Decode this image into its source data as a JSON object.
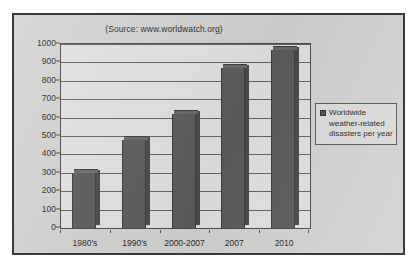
{
  "chart_data": {
    "type": "bar",
    "title": "(Source: www.worldwatch.org)",
    "xlabel": "",
    "ylabel": "",
    "categories": [
      "1980's",
      "1990's",
      "2000-2007",
      "2007",
      "2010"
    ],
    "values": [
      300,
      480,
      620,
      870,
      970
    ],
    "series": [
      {
        "name": "Worldwide weather-related disasters per year",
        "values": [
          300,
          480,
          620,
          870,
          970
        ]
      }
    ],
    "ylim": [
      0,
      1000
    ],
    "ytick_labels": [
      "0",
      "100",
      "200",
      "300",
      "400",
      "500",
      "600",
      "700",
      "800",
      "900",
      "1000"
    ],
    "ytick_values": [
      0,
      100,
      200,
      300,
      400,
      500,
      600,
      700,
      800,
      900,
      1000
    ],
    "grid": true,
    "legend_position": "right",
    "legend_entries": [
      "Worldwide weather-related disasters per year"
    ]
  },
  "legend": {
    "line1": "Worldwide",
    "line2": "weather-related",
    "line3": "disasters per year",
    "marker": "square-marker"
  },
  "colors": {
    "bar_front": "#5c5c5c",
    "bar_side": "#4a4a4a",
    "bar_top": "#6b6b6b",
    "plot_background": "#e2e2e1",
    "panel_background": "#d3d3d2",
    "frame_border": "#3a3a3a",
    "gridline": "#636363",
    "text": "#2b2b2b"
  }
}
